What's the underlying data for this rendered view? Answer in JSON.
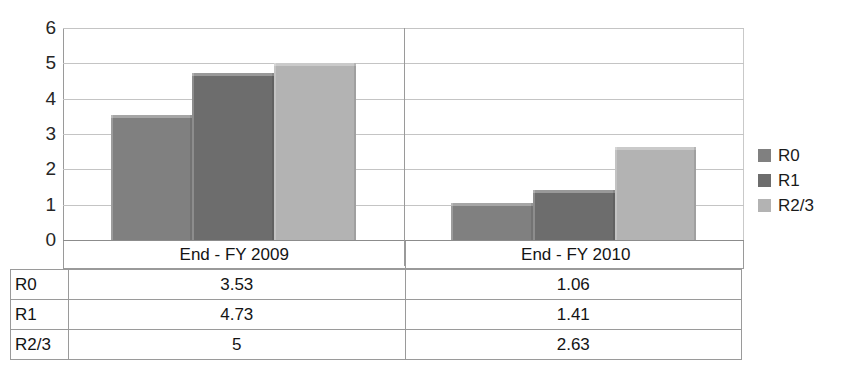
{
  "chart_data": {
    "type": "bar",
    "title": "",
    "subtitle": "",
    "xlabel": "",
    "ylabel": "",
    "categories": [
      "End - FY 2009",
      "End - FY 2010"
    ],
    "series": [
      {
        "name": "R0",
        "values": [
          3.53,
          4.73
        ]
      },
      {
        "name": "R1",
        "values": [
          4.73,
          1.41
        ]
      },
      {
        "name": "R2/3",
        "values": [
          5,
          2.63
        ]
      }
    ],
    "series_corrected": [
      {
        "name": "R0",
        "values": [
          3.53,
          1.06
        ],
        "color": "#808080"
      },
      {
        "name": "R1",
        "values": [
          4.73,
          1.41
        ],
        "color": "#6d6d6d"
      },
      {
        "name": "R2/3",
        "values": [
          5,
          2.63
        ],
        "color": "#b3b3b3"
      }
    ],
    "ylim": [
      0,
      6
    ],
    "yticks": [
      "0",
      "1",
      "2",
      "3",
      "4",
      "5",
      "6"
    ],
    "grid": true,
    "legend_position": "right",
    "data_table_shown": true
  },
  "axis": {
    "yticks": [
      "6",
      "5",
      "4",
      "3",
      "2",
      "1",
      "0"
    ],
    "ymin": 0,
    "ymax": 6
  },
  "categories": [
    {
      "label": "End - FY 2009"
    },
    {
      "label": "End - FY 2010"
    }
  ],
  "legend": {
    "items": [
      {
        "label": "R0",
        "color": "#808080"
      },
      {
        "label": "R1",
        "color": "#6d6d6d"
      },
      {
        "label": "R2/3",
        "color": "#b3b3b3"
      }
    ]
  },
  "table": {
    "rows": [
      {
        "label": "R0",
        "values": [
          "3.53",
          "1.06"
        ]
      },
      {
        "label": "R1",
        "values": [
          "4.73",
          "1.41"
        ]
      },
      {
        "label": "R2/3",
        "values": [
          "5",
          "2.63"
        ]
      }
    ]
  },
  "bars": [
    {
      "series": "R0",
      "category": "End - FY 2009",
      "value": 3.53,
      "color": "#808080"
    },
    {
      "series": "R1",
      "category": "End - FY 2009",
      "value": 4.73,
      "color": "#6d6d6d"
    },
    {
      "series": "R2/3",
      "category": "End - FY 2009",
      "value": 5,
      "color": "#b3b3b3"
    },
    {
      "series": "R0",
      "category": "End - FY 2010",
      "value": 1.06,
      "color": "#808080"
    },
    {
      "series": "R1",
      "category": "End - FY 2010",
      "value": 1.41,
      "color": "#6d6d6d"
    },
    {
      "series": "R2/3",
      "category": "End - FY 2010",
      "value": 2.63,
      "color": "#b3b3b3"
    }
  ]
}
